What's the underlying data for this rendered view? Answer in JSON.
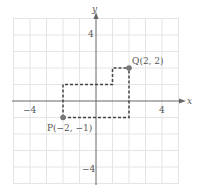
{
  "figure": {
    "axes": {
      "x_label": "x",
      "y_label": "y",
      "x_range": [
        -5,
        5
      ],
      "y_range": [
        -5,
        5
      ],
      "tick_labels": {
        "x_neg": "−4",
        "x_pos": "4",
        "y_pos": "4",
        "y_neg": "−4"
      }
    },
    "points": [
      {
        "name": "P",
        "label": "P(−2, −1)",
        "x": -2,
        "y": -1
      },
      {
        "name": "Q",
        "label": "Q(2, 2)",
        "x": 2,
        "y": 2
      }
    ],
    "paths": [
      {
        "style": "dashed",
        "description": "P up to (-2,1), right to (1,1), up to (1,2), right to Q",
        "points": [
          [
            -2,
            -1
          ],
          [
            -2,
            1
          ],
          [
            1,
            1
          ],
          [
            1,
            2
          ],
          [
            2,
            2
          ]
        ]
      },
      {
        "style": "dashed",
        "description": "P right to (2,-1), up to Q",
        "points": [
          [
            -2,
            -1
          ],
          [
            2,
            -1
          ],
          [
            2,
            2
          ]
        ]
      }
    ],
    "colors": {
      "grid": "#e4e4e4",
      "axis": "#666666",
      "dash": "#444444",
      "point": "#777777",
      "text": "#555555"
    }
  }
}
